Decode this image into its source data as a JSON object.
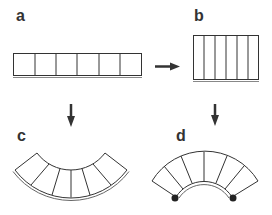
{
  "figure": {
    "panels": [
      {
        "id": "a",
        "label": "a",
        "shape": "flat-strip-horizontal",
        "cells": 6,
        "x": 18,
        "y": 8
      },
      {
        "id": "b",
        "label": "b",
        "shape": "compressed-strip-vertical-cells",
        "cells": 6,
        "x": 196,
        "y": 8
      },
      {
        "id": "c",
        "label": "c",
        "shape": "curved-concave-up-with-backing",
        "cells": 6,
        "x": 20,
        "y": 128
      },
      {
        "id": "d",
        "label": "d",
        "shape": "curved-concave-down-with-anchors",
        "cells": 6,
        "x": 177,
        "y": 128
      }
    ],
    "arrows": [
      {
        "from": "a",
        "to": "b",
        "direction": "right"
      },
      {
        "from": "a",
        "to": "c",
        "direction": "down"
      },
      {
        "from": "b",
        "to": "d",
        "direction": "down"
      }
    ],
    "colors": {
      "stroke": "#333333",
      "fill": "#ffffff",
      "backing": "#888888"
    }
  }
}
